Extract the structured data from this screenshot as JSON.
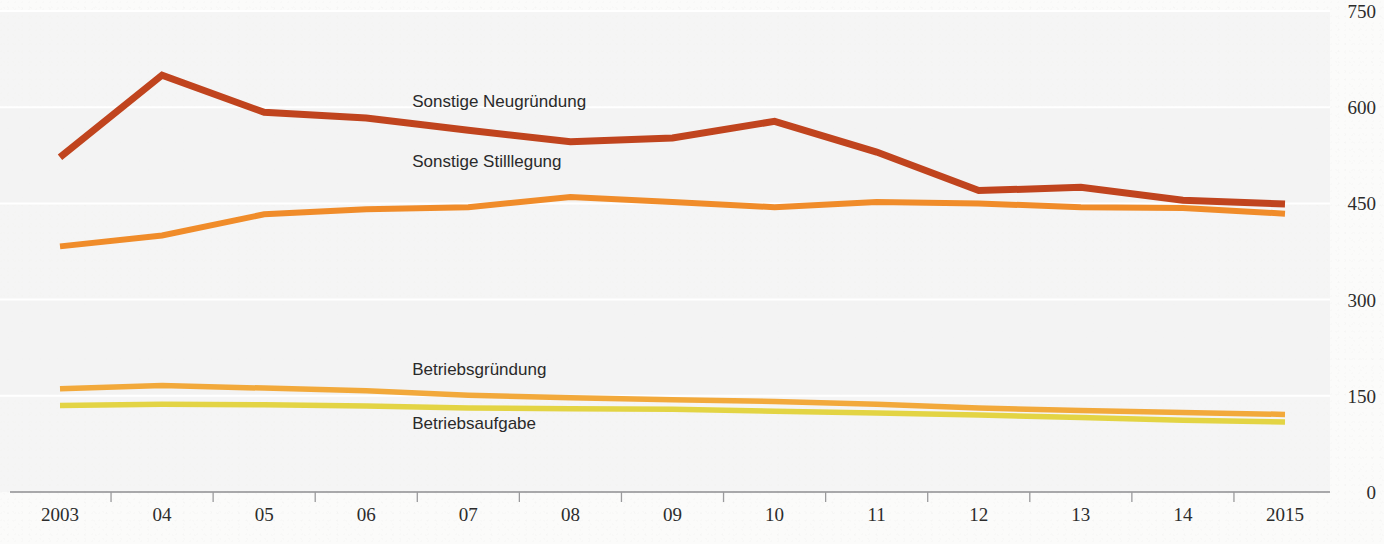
{
  "chart_data": {
    "type": "line",
    "title": "",
    "subtitle": "",
    "xlabel": "",
    "ylabel": "",
    "xlim": [
      2003,
      2015
    ],
    "ylim": [
      0,
      750
    ],
    "grid": true,
    "grid_axis": "y",
    "legend_position": "inline-labels",
    "x": [
      2003,
      2004,
      2005,
      2006,
      2007,
      2008,
      2009,
      2010,
      2011,
      2012,
      2013,
      2014,
      2015
    ],
    "x_tick_labels": [
      "2003",
      "04",
      "05",
      "06",
      "07",
      "08",
      "09",
      "10",
      "11",
      "12",
      "13",
      "14",
      "2015"
    ],
    "y_tick_labels": [
      "750",
      "600",
      "450",
      "300",
      "150",
      "0"
    ],
    "y_ticks": [
      750,
      600,
      450,
      300,
      150,
      0
    ],
    "series": [
      {
        "name": "Sonstige Neugründung",
        "color": "#C0441E",
        "label_x": 2006.45,
        "label_y": 600,
        "values": [
          522,
          650,
          592,
          583,
          564,
          546,
          552,
          578,
          530,
          470,
          475,
          455,
          449
        ]
      },
      {
        "name": "Sonstige Stilllegung",
        "color": "#F08C2A",
        "label_x": 2006.45,
        "label_y": 506,
        "values": [
          383,
          400,
          433,
          441,
          444,
          460,
          452,
          444,
          452,
          450,
          444,
          443,
          434
        ]
      },
      {
        "name": "Betriebsgründung",
        "color": "#F2A93B",
        "label_x": 2006.45,
        "label_y": 182,
        "values": [
          161,
          166,
          162,
          158,
          151,
          147,
          144,
          141,
          137,
          131,
          127,
          124,
          121
        ]
      },
      {
        "name": "Betriebsaufgabe",
        "color": "#E3D444",
        "label_x": 2006.45,
        "label_y": 98,
        "values": [
          135,
          137,
          136,
          134,
          131,
          130,
          129,
          126,
          123,
          120,
          116,
          112,
          109
        ]
      }
    ]
  }
}
